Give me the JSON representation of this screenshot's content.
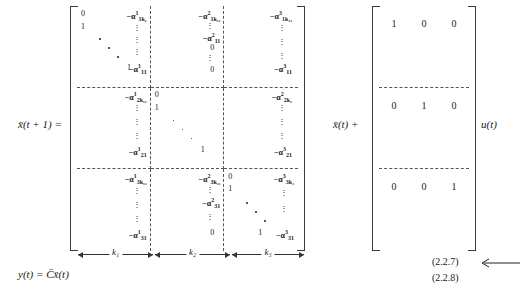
{
  "equation": {
    "lhs_state": "x̄(t + 1) =",
    "lhs_output": "y(t) = C̄x̄(t)",
    "plus_state": "x̄(t) +",
    "input_vector": "u(t)"
  },
  "matrix_A": {
    "blocks": [
      {
        "row": 1,
        "col": 1,
        "entries": [
          {
            "text": "0",
            "kind": "number",
            "pos": "tl"
          },
          {
            "text": "1",
            "kind": "number",
            "pos": "l2"
          },
          {
            "text": "1",
            "kind": "number",
            "pos": "bl"
          }
        ],
        "has_diagonal_dots": true
      },
      {
        "row": 1,
        "col": 2,
        "entries": [
          {
            "text": "−α",
            "sup": "1",
            "sub": "1k₁",
            "kind": "alpha",
            "pos": "t"
          },
          {
            "text": "−α",
            "sup": "1",
            "sub": "11",
            "kind": "alpha",
            "pos": "b"
          }
        ],
        "has_vertical_dots": true
      },
      {
        "row": 1,
        "col": 3,
        "entries": [
          {
            "text": "−α",
            "sup": "2",
            "sub": "1k₁₂",
            "kind": "alpha",
            "pos": "t"
          },
          {
            "text": "−α",
            "sup": "2",
            "sub": "11",
            "kind": "alpha",
            "pos": "m"
          },
          {
            "text": "0",
            "kind": "number",
            "pos": "m2"
          },
          {
            "text": "0",
            "kind": "number",
            "pos": "b"
          }
        ],
        "has_vertical_dots": true
      },
      {
        "row": 1,
        "col": 4,
        "entries": [
          {
            "text": "−α",
            "sup": "3",
            "sub": "1k₃",
            "kind": "alpha",
            "pos": "t"
          },
          {
            "text": "−α",
            "sup": "3",
            "sub": "11",
            "kind": "alpha",
            "pos": "b"
          }
        ],
        "has_vertical_dots": true
      },
      {
        "row": 2,
        "col": 1,
        "entries": [
          {
            "text": "−α",
            "sup": "1",
            "sub": "2k₁₂",
            "kind": "alpha",
            "pos": "t"
          },
          {
            "text": "−α",
            "sup": "1",
            "sub": "21",
            "kind": "alpha",
            "pos": "b"
          }
        ],
        "has_vertical_dots": true
      },
      {
        "row": 2,
        "col": 2,
        "entries": [
          {
            "text": "0",
            "kind": "number",
            "pos": "tl"
          },
          {
            "text": "1",
            "kind": "number",
            "pos": "l2"
          },
          {
            "text": "1",
            "kind": "number",
            "pos": "bl"
          }
        ],
        "has_diagonal_dots": true
      },
      {
        "row": 2,
        "col": 3,
        "entries": [
          {
            "text": "−α",
            "sup": "2",
            "sub": "2k₂",
            "kind": "alpha",
            "pos": "t"
          },
          {
            "text": "−α",
            "sup": "2",
            "sub": "22",
            "kind": "alpha",
            "pos": "b"
          }
        ],
        "has_vertical_dots": true
      },
      {
        "row": 3,
        "col": 1,
        "entries": [
          {
            "text": "−α",
            "sup": "1",
            "sub": "3k₁₃",
            "kind": "alpha",
            "pos": "t"
          },
          {
            "text": "−α",
            "sup": "1",
            "sub": "31",
            "kind": "alpha",
            "pos": "b"
          }
        ],
        "has_vertical_dots": true
      },
      {
        "row": 3,
        "col": 2,
        "entries": [
          {
            "text": "−α",
            "sup": "2",
            "sub": "3k₂₃",
            "kind": "alpha",
            "pos": "t"
          },
          {
            "text": "−α",
            "sup": "2",
            "sub": "31",
            "kind": "alpha",
            "pos": "m"
          },
          {
            "text": "0",
            "kind": "number",
            "pos": "b"
          }
        ],
        "has_vertical_dots": true
      },
      {
        "row": 3,
        "col": 3,
        "entries": [
          {
            "text": "−α",
            "sup": "3",
            "sub": "3k₃",
            "kind": "alpha",
            "pos": "t"
          },
          {
            "text": "−α",
            "sup": "3",
            "sub": "31",
            "kind": "alpha",
            "pos": "b"
          },
          {
            "text": "0",
            "kind": "number",
            "pos": "tl"
          },
          {
            "text": "1",
            "kind": "number",
            "pos": "l2"
          },
          {
            "text": "1",
            "kind": "number",
            "pos": "bl"
          }
        ],
        "has_diagonal_dots": true
      }
    ],
    "cells": {
      "r1c1": {
        "top_left": "0",
        "second": "1",
        "bottom_one": "1",
        "alpha_top": "−α",
        "alpha_top_sup": "1",
        "alpha_top_sub": "1k₁",
        "alpha_bot": "−α",
        "alpha_bot_sup": "1",
        "alpha_bot_sub": "11"
      },
      "r1c2": {
        "alpha_top": "−α",
        "alpha_top_sup": "2",
        "alpha_top_sub": "1k₁₂",
        "alpha_mid": "−α",
        "alpha_mid_sup": "2",
        "alpha_mid_sub": "11",
        "zero_a": "0",
        "zero_b": "0"
      },
      "r1c3": {
        "alpha_top": "−α",
        "alpha_top_sup": "3",
        "alpha_top_sub": "1k₁₃",
        "alpha_bot": "−α",
        "alpha_bot_sup": "3",
        "alpha_bot_sub": "11"
      },
      "r2c1": {
        "alpha_top": "−α",
        "alpha_top_sup": "1",
        "alpha_top_sub": "2k₁₂",
        "alpha_bot": "−α",
        "alpha_bot_sup": "1",
        "alpha_bot_sub": "21"
      },
      "r2c2": {
        "top_left": "0",
        "second": "1",
        "bottom_one": "1"
      },
      "r2c3": {
        "alpha_top": "−α",
        "alpha_top_sup": "2",
        "alpha_top_sub": "2k₂",
        "alpha_bot": "−α",
        "alpha_bot_sup": "2",
        "alpha_bot_sub": "22",
        "alpha_tail": "−α",
        "alpha_tail_sup": "3",
        "alpha_tail_sub": "21"
      },
      "r3c1": {
        "alpha_top": "−α",
        "alpha_top_sup": "1",
        "alpha_top_sub": "3k₁₃",
        "alpha_bot": "−α",
        "alpha_bot_sup": "1",
        "alpha_bot_sub": "31"
      },
      "r3c2": {
        "alpha_top": "−α",
        "alpha_top_sup": "2",
        "alpha_top_sub": "3k₂₃",
        "alpha_mid": "−α",
        "alpha_mid_sup": "2",
        "alpha_mid_sub": "31",
        "zero_b": "0"
      },
      "r3c3": {
        "top_left": "0",
        "second": "1",
        "bottom_one": "1",
        "alpha_top": "−α",
        "alpha_top_sup": "3",
        "alpha_top_sub": "3k₃",
        "alpha_bot": "−α",
        "alpha_bot_sup": "3",
        "alpha_bot_sub": "31"
      }
    },
    "vdots": "⋮"
  },
  "matrix_B": {
    "rows": [
      [
        "1",
        "0",
        "0"
      ],
      [
        "0",
        "1",
        "0"
      ],
      [
        "0",
        "0",
        "1"
      ]
    ]
  },
  "dimension_braces": [
    {
      "label": "k₁"
    },
    {
      "label": "k₂"
    },
    {
      "label": "k₃"
    }
  ],
  "equation_numbers": {
    "first": "(2.2.7)",
    "second": "(2.2.8)"
  }
}
